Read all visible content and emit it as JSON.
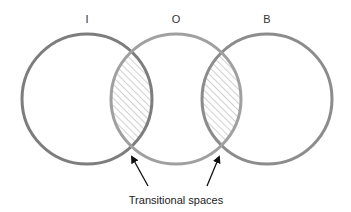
{
  "diagram": {
    "labels": {
      "left": "I",
      "middle": "O",
      "right": "B"
    },
    "caption": "Transitional spaces",
    "circles": [
      {
        "id": "I",
        "cx": 87,
        "cy": 99,
        "r": 65,
        "stroke": "#7d7d7d"
      },
      {
        "id": "O",
        "cx": 176,
        "cy": 99,
        "r": 65,
        "stroke": "#a0a0a0"
      },
      {
        "id": "B",
        "cx": 267,
        "cy": 99,
        "r": 65,
        "stroke": "#8c8c8c"
      }
    ],
    "hatch_color": "#9a9a9a",
    "arrow_color": "#111111"
  }
}
